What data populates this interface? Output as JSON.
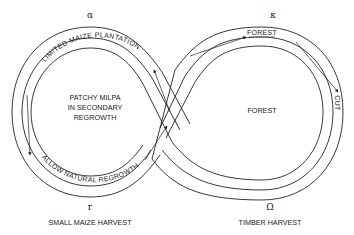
{
  "diagram": {
    "type": "figure-eight cycle",
    "nodes": {
      "alpha": {
        "symbol": "α",
        "label": ""
      },
      "kappa": {
        "symbol": "κ",
        "label": ""
      },
      "gamma": {
        "symbol": "r",
        "label": "SMALL MAIZE HARVEST"
      },
      "omega": {
        "symbol": "Ω",
        "label": "TIMBER HARVEST"
      }
    },
    "left_loop": {
      "center_label_lines": [
        "PATCHY MILPA",
        "IN SECONDARY",
        "REGROWTH"
      ],
      "top_track_label": "LIMITED MAIZE PLANTATION",
      "bottom_track_label": "ALLOW NATURAL REGROWTH"
    },
    "right_loop": {
      "center_label": "FOREST",
      "top_track_label": "FOREST",
      "right_track_label": "CUT"
    }
  }
}
